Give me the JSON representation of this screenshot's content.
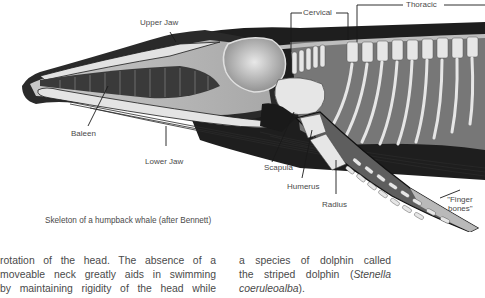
{
  "figure": {
    "labels": {
      "upper_jaw": "Upper Jaw",
      "cervical": "Cervical",
      "thoracic": "Thoracic",
      "baleen": "Baleen",
      "lower_jaw": "Lower Jaw",
      "scapula": "Scapula",
      "humerus": "Humerus",
      "radius": "Radius",
      "finger_bones_line1": "\"Finger",
      "finger_bones_line2": "bones\""
    },
    "caption": "Skeleton of a humpback whale (after Bennett)"
  },
  "body_text": {
    "left_column": [
      "rotation of the head. The absence of a",
      "moveable neck greatly aids in swimming",
      "by maintaining rigidity of the head while"
    ],
    "right_column": {
      "line1": "a species of dolphin called",
      "line2_prefix": "the striped dolphin (",
      "line2_italic": "Stenella",
      "line3_italic": "coeruleoalba",
      "line3_suffix": ")."
    }
  },
  "colors": {
    "body_dark": "#1e1e1e",
    "body_mid": "#5a5a5a",
    "bone": "#e6e6e6",
    "skull_gray": "#9a9a9a",
    "text": "#4a4a4a"
  }
}
